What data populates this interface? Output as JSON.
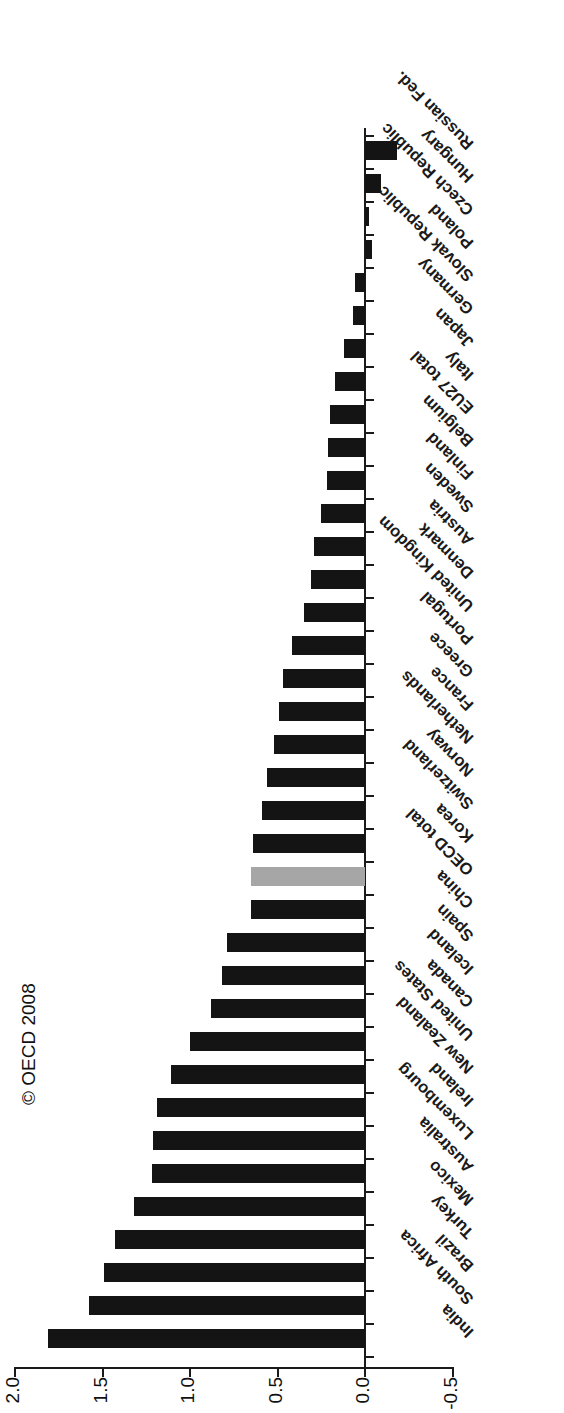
{
  "chart_data": {
    "type": "bar",
    "orientation": "vertical-rotated",
    "title": "",
    "xlabel": "",
    "ylabel": "",
    "ylim": [
      -0.5,
      2.0
    ],
    "yticks": [
      "-0.5",
      "0.0",
      "0.5",
      "1.0",
      "1.5",
      "2.0"
    ],
    "ytick_values": [
      -0.5,
      0.0,
      0.5,
      1.0,
      1.5,
      2.0
    ],
    "grid": false,
    "legend": null,
    "highlight_category": "OECD total",
    "highlight_color": "#a6a6a6",
    "bar_color": "#141414",
    "categories": [
      "India",
      "South Africa",
      "Brazil",
      "Turkey",
      "Mexico",
      "Australia",
      "Luxembourg",
      "Ireland",
      "New Zealand",
      "United States",
      "Canada",
      "Iceland",
      "Spain",
      "China",
      "OECD total",
      "Korea",
      "Switzerland",
      "Norway",
      "Netherlands",
      "France",
      "Greece",
      "Portugal",
      "United Kingdom",
      "Denmark",
      "Austria",
      "Sweden",
      "Finland",
      "Belgium",
      "EU27 total",
      "Italy",
      "Japan",
      "Germany",
      "Slovak Republic",
      "Poland",
      "Czech Republic",
      "Hungary",
      "Russian Fed."
    ],
    "values": [
      1.81,
      1.58,
      1.49,
      1.43,
      1.32,
      1.22,
      1.21,
      1.19,
      1.11,
      1.0,
      0.88,
      0.82,
      0.79,
      0.65,
      0.65,
      0.64,
      0.59,
      0.56,
      0.52,
      0.49,
      0.47,
      0.42,
      0.35,
      0.31,
      0.29,
      0.25,
      0.22,
      0.21,
      0.2,
      0.17,
      0.12,
      0.07,
      0.06,
      -0.04,
      -0.02,
      -0.09,
      -0.18
    ]
  },
  "annotations": {
    "copyright": "© OECD 2008"
  }
}
